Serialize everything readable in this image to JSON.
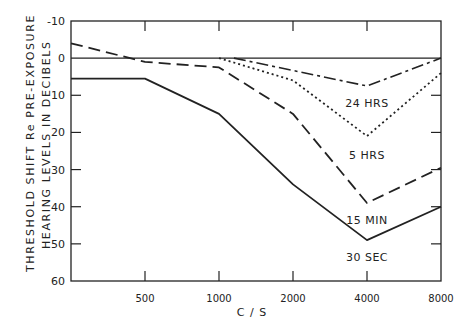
{
  "chart_data": {
    "type": "line",
    "title": "",
    "xlabel": "C / S",
    "ylabel_lines": [
      "THRESHOLD SHIFT Re PRE-EXPOSURE",
      "HEARING LEVELS IN DECIBELS"
    ],
    "x": [
      250,
      500,
      1000,
      2000,
      4000,
      8000
    ],
    "x_tick_labels": [
      "500",
      "1000",
      "2000",
      "4000",
      "8000"
    ],
    "x_tick_values": [
      500,
      1000,
      2000,
      4000,
      8000
    ],
    "x_scale": "log2",
    "xlim": [
      250,
      8000
    ],
    "y_tick_labels": [
      "-10",
      "0",
      "10",
      "20",
      "30",
      "40",
      "50",
      "60"
    ],
    "y_tick_values": [
      -10,
      0,
      10,
      20,
      30,
      40,
      50,
      60
    ],
    "ylim": [
      -10,
      60
    ],
    "y_inverted": true,
    "reference_line": 0,
    "grid": false,
    "series": [
      {
        "name": "30 SEC",
        "style": "solid",
        "points": [
          [
            250,
            5.5
          ],
          [
            500,
            5.5
          ],
          [
            1000,
            15
          ],
          [
            2000,
            34
          ],
          [
            4000,
            49
          ],
          [
            8000,
            40
          ]
        ],
        "label_pos": [
          4000,
          53.5
        ]
      },
      {
        "name": "15 MIN",
        "style": "dashed",
        "points": [
          [
            250,
            -4
          ],
          [
            500,
            1
          ],
          [
            1000,
            2.5
          ],
          [
            2000,
            15
          ],
          [
            4000,
            39
          ],
          [
            8000,
            29.5
          ]
        ],
        "label_pos": [
          4000,
          43.5
        ]
      },
      {
        "name": "5 HRS",
        "style": "dotted",
        "points": [
          [
            1000,
            0
          ],
          [
            2000,
            6
          ],
          [
            4000,
            21
          ],
          [
            8000,
            4
          ]
        ],
        "label_pos": [
          4000,
          26
        ]
      },
      {
        "name": "24 HRS",
        "style": "dash-dot",
        "points": [
          [
            1150,
            0
          ],
          [
            4000,
            7.5
          ],
          [
            8000,
            0
          ]
        ],
        "label_pos": [
          4000,
          12
        ]
      }
    ]
  }
}
